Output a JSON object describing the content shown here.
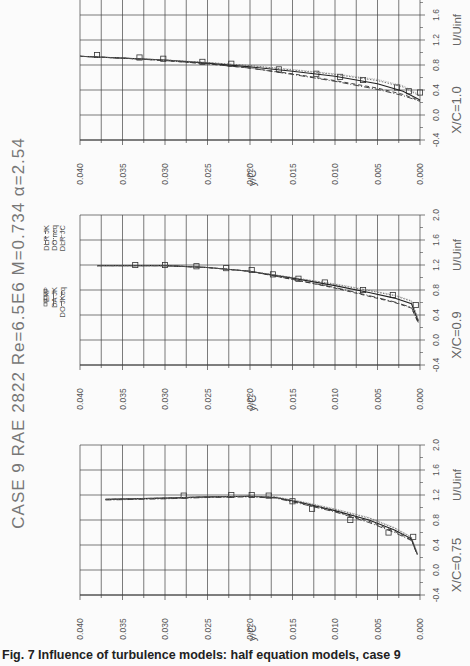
{
  "figure": {
    "title": "CASE 9  RAE 2822  Re=6.5E6  M=0.734  α=2.54",
    "title_parts": {
      "case": "CASE 9",
      "airfoil": "RAE 2822",
      "reynolds": "Re=6.5E6",
      "mach": "M=0.734",
      "alpha": "α=2.54"
    },
    "caption": "Fig. 7    Influence of turbulence models: half equation models, case 9",
    "orientation": "rotated 90° counter-clockwise",
    "legend": [
      {
        "label": "EXP",
        "style": "squares"
      },
      {
        "label": "DA  JK",
        "style": "solid"
      },
      {
        "label": "DO  JKeq",
        "style": "dash-dot"
      },
      {
        "label": "DLR  JK",
        "style": "dashed"
      },
      {
        "label": "DO  neq",
        "style": "dotted"
      },
      {
        "label": "DLR  JC",
        "style": "fine-dotted"
      }
    ]
  },
  "chart_data": [
    {
      "type": "line",
      "title": "X/C=0.75",
      "xlabel": "y/C",
      "ylabel": "U/Uinf",
      "xlim": [
        0.04,
        0.0
      ],
      "ylim": [
        -0.4,
        2.0
      ],
      "xticks": [
        "0.040",
        "0.035",
        "0.030",
        "0.025",
        "0.020",
        "0.015",
        "0.010",
        "0.005",
        "0.000"
      ],
      "yticks": [
        "-0.4",
        "0.0",
        "0.4",
        "0.8",
        "1.2",
        "1.6",
        "2.0"
      ],
      "grid": true,
      "series": [
        {
          "name": "EXP",
          "x": [
            0.0278,
            0.0222,
            0.0198,
            0.0178,
            0.015,
            0.0127,
            0.0082,
            0.0037,
            0.0008
          ],
          "y": [
            1.19,
            1.2,
            1.2,
            1.19,
            1.1,
            0.98,
            0.8,
            0.6,
            0.53
          ]
        },
        {
          "name": "DA JK",
          "x": [
            0.037,
            0.03,
            0.025,
            0.02,
            0.017,
            0.014,
            0.01,
            0.006,
            0.003,
            0.001,
            0.0003
          ],
          "y": [
            1.13,
            1.15,
            1.17,
            1.18,
            1.16,
            1.08,
            0.95,
            0.8,
            0.64,
            0.5,
            0.25
          ]
        },
        {
          "name": "DO JKeq",
          "x": [
            0.037,
            0.03,
            0.025,
            0.02,
            0.017,
            0.014,
            0.01,
            0.006,
            0.003,
            0.001,
            0.0003
          ],
          "y": [
            1.12,
            1.14,
            1.16,
            1.17,
            1.15,
            1.06,
            0.93,
            0.76,
            0.6,
            0.47,
            0.24
          ]
        },
        {
          "name": "DLR JK",
          "x": [
            0.037,
            0.03,
            0.025,
            0.02,
            0.017,
            0.014,
            0.01,
            0.006,
            0.003,
            0.001,
            0.0003
          ],
          "y": [
            1.13,
            1.15,
            1.17,
            1.18,
            1.16,
            1.07,
            0.94,
            0.78,
            0.62,
            0.48,
            0.24
          ]
        },
        {
          "name": "DO neq",
          "x": [
            0.037,
            0.03,
            0.025,
            0.02,
            0.017,
            0.014,
            0.01,
            0.006,
            0.003,
            0.001,
            0.0003
          ],
          "y": [
            1.13,
            1.15,
            1.17,
            1.18,
            1.17,
            1.09,
            0.97,
            0.83,
            0.67,
            0.52,
            0.26
          ]
        },
        {
          "name": "DLR JC",
          "x": [
            0.037,
            0.03,
            0.025,
            0.02,
            0.017,
            0.014,
            0.01,
            0.006,
            0.003,
            0.001,
            0.0003
          ],
          "y": [
            1.13,
            1.15,
            1.17,
            1.18,
            1.17,
            1.1,
            0.98,
            0.84,
            0.68,
            0.53,
            0.27
          ]
        }
      ]
    },
    {
      "type": "line",
      "title": "X/C=0.9",
      "xlabel": "y/C",
      "ylabel": "U/Uinf",
      "xlim": [
        0.04,
        0.0
      ],
      "ylim": [
        -0.4,
        2.0
      ],
      "xticks": [
        "0.040",
        "0.035",
        "0.030",
        "0.025",
        "0.020",
        "0.015",
        "0.010",
        "0.005",
        "0.000"
      ],
      "yticks": [
        "-0.4",
        "0.0",
        "0.4",
        "0.8",
        "1.2",
        "1.6",
        "2.0"
      ],
      "grid": true,
      "series": [
        {
          "name": "EXP",
          "x": [
            0.0335,
            0.03,
            0.0263,
            0.0228,
            0.0198,
            0.0173,
            0.0143,
            0.0112,
            0.0067,
            0.0032,
            0.0005
          ],
          "y": [
            1.2,
            1.2,
            1.18,
            1.15,
            1.12,
            1.05,
            0.98,
            0.92,
            0.8,
            0.72,
            0.56
          ]
        },
        {
          "name": "DA JK",
          "x": [
            0.038,
            0.03,
            0.025,
            0.02,
            0.015,
            0.01,
            0.006,
            0.003,
            0.001,
            0.0002
          ],
          "y": [
            1.19,
            1.19,
            1.16,
            1.1,
            0.99,
            0.87,
            0.76,
            0.67,
            0.58,
            0.3
          ]
        },
        {
          "name": "DO JKeq",
          "x": [
            0.038,
            0.03,
            0.025,
            0.02,
            0.015,
            0.01,
            0.006,
            0.003,
            0.001,
            0.0002
          ],
          "y": [
            1.19,
            1.19,
            1.16,
            1.1,
            0.97,
            0.84,
            0.71,
            0.61,
            0.52,
            0.28
          ]
        },
        {
          "name": "DLR JK",
          "x": [
            0.038,
            0.03,
            0.025,
            0.02,
            0.015,
            0.01,
            0.006,
            0.003,
            0.001,
            0.0002
          ],
          "y": [
            1.19,
            1.19,
            1.16,
            1.1,
            0.97,
            0.83,
            0.7,
            0.6,
            0.51,
            0.27
          ]
        },
        {
          "name": "DO neq",
          "x": [
            0.038,
            0.03,
            0.025,
            0.02,
            0.015,
            0.01,
            0.006,
            0.003,
            0.001,
            0.0002
          ],
          "y": [
            1.19,
            1.19,
            1.16,
            1.1,
            1.0,
            0.89,
            0.79,
            0.71,
            0.62,
            0.32
          ]
        },
        {
          "name": "DLR JC",
          "x": [
            0.038,
            0.03,
            0.025,
            0.02,
            0.015,
            0.01,
            0.006,
            0.003,
            0.001,
            0.0002
          ],
          "y": [
            1.19,
            1.19,
            1.16,
            1.1,
            1.0,
            0.9,
            0.8,
            0.72,
            0.63,
            0.33
          ]
        }
      ]
    },
    {
      "type": "line",
      "title": "X/C=1.0",
      "xlabel": "y/C",
      "ylabel": "U/Uinf",
      "xlim": [
        0.04,
        0.0
      ],
      "ylim": [
        -0.4,
        2.0
      ],
      "xticks": [
        "0.040",
        "0.035",
        "0.030",
        "0.025",
        "0.020",
        "0.015",
        "0.010",
        "0.005",
        "0.000"
      ],
      "yticks": [
        "-0.4",
        "0.0",
        "0.4",
        "0.8",
        "1.2",
        "1.6",
        "2.0"
      ],
      "grid": true,
      "series": [
        {
          "name": "EXP",
          "x": [
            0.038,
            0.033,
            0.0302,
            0.0256,
            0.0222,
            0.0166,
            0.0122,
            0.0094,
            0.0067,
            0.0027,
            0.0013,
            0.0
          ],
          "y": [
            0.96,
            0.92,
            0.9,
            0.85,
            0.82,
            0.73,
            0.66,
            0.61,
            0.56,
            0.44,
            0.38,
            0.36
          ]
        },
        {
          "name": "DA JK",
          "x": [
            0.04,
            0.035,
            0.03,
            0.025,
            0.02,
            0.015,
            0.01,
            0.005,
            0.002,
            0.0
          ],
          "y": [
            0.94,
            0.91,
            0.88,
            0.83,
            0.77,
            0.7,
            0.62,
            0.5,
            0.38,
            0.24
          ]
        },
        {
          "name": "DO JKeq",
          "x": [
            0.04,
            0.035,
            0.03,
            0.025,
            0.02,
            0.015,
            0.01,
            0.005,
            0.002,
            0.0
          ],
          "y": [
            0.94,
            0.91,
            0.87,
            0.82,
            0.75,
            0.65,
            0.54,
            0.41,
            0.31,
            0.22
          ]
        },
        {
          "name": "DLR JK",
          "x": [
            0.04,
            0.035,
            0.03,
            0.025,
            0.02,
            0.015,
            0.01,
            0.005,
            0.002,
            0.0
          ],
          "y": [
            0.94,
            0.91,
            0.87,
            0.82,
            0.75,
            0.66,
            0.55,
            0.43,
            0.33,
            0.23
          ]
        },
        {
          "name": "DO neq",
          "x": [
            0.04,
            0.035,
            0.03,
            0.025,
            0.02,
            0.015,
            0.01,
            0.005,
            0.002,
            0.0
          ],
          "y": [
            0.94,
            0.91,
            0.88,
            0.84,
            0.79,
            0.72,
            0.65,
            0.55,
            0.45,
            0.3
          ]
        },
        {
          "name": "DLR JC",
          "x": [
            0.04,
            0.035,
            0.03,
            0.025,
            0.02,
            0.015,
            0.01,
            0.005,
            0.002,
            0.0
          ],
          "y": [
            0.94,
            0.91,
            0.88,
            0.84,
            0.79,
            0.73,
            0.66,
            0.57,
            0.47,
            0.32
          ]
        }
      ]
    }
  ],
  "panels": [
    {
      "id": "xc075",
      "label": "X/C=0.75",
      "xaxis_label": "y/C",
      "yaxis_label": "U/Uinf"
    },
    {
      "id": "xc09",
      "label": "X/C=0.9",
      "xaxis_label": "y/C",
      "yaxis_label": "U/Uinf"
    },
    {
      "id": "xc10",
      "label": "X/C=1.0",
      "xaxis_label": "y/C",
      "yaxis_label": "U/Uinf"
    }
  ]
}
